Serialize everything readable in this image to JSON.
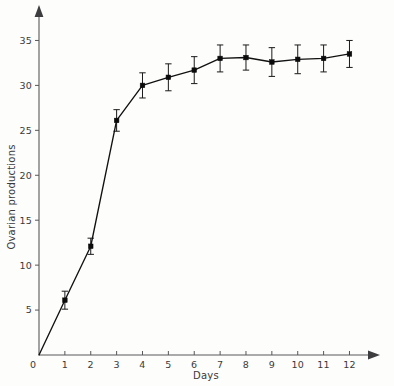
{
  "chart_data": {
    "type": "line",
    "title": "",
    "subtitle": "",
    "xlabel": "Days",
    "ylabel": "Ovarian productions",
    "xlim": [
      0,
      12.6
    ],
    "ylim": [
      0,
      37.5
    ],
    "grid": false,
    "legend": "none",
    "x_ticks": [
      "0",
      "1",
      "2",
      "3",
      "4",
      "5",
      "6",
      "7",
      "8",
      "9",
      "10",
      "11",
      "12"
    ],
    "x_tick_values": [
      0,
      1,
      2,
      3,
      4,
      5,
      6,
      7,
      8,
      9,
      10,
      11,
      12
    ],
    "y_ticks": [
      "5",
      "10",
      "15",
      "20",
      "25",
      "30",
      "35"
    ],
    "y_tick_values": [
      5,
      10,
      15,
      20,
      25,
      30,
      35
    ],
    "origin_label": "0",
    "x": [
      0,
      1,
      2,
      3,
      4,
      5,
      6,
      7,
      8,
      9,
      10,
      11,
      12
    ],
    "values": [
      0,
      6.1,
      12.1,
      26.1,
      30.0,
      30.9,
      31.7,
      33.0,
      33.1,
      32.6,
      32.9,
      33.0,
      33.5
    ],
    "error_lower": [
      0,
      1.0,
      0.9,
      1.2,
      1.4,
      1.5,
      1.5,
      1.5,
      1.4,
      1.6,
      1.6,
      1.5,
      1.5
    ],
    "error_upper": [
      0,
      1.0,
      0.9,
      1.2,
      1.4,
      1.5,
      1.5,
      1.5,
      1.4,
      1.6,
      1.6,
      1.5,
      1.5
    ],
    "series": [
      {
        "name": "Ovarian productions",
        "values": [
          0,
          6.1,
          12.1,
          26.1,
          30.0,
          30.9,
          31.7,
          33.0,
          33.1,
          32.6,
          32.9,
          33.0,
          33.5
        ]
      }
    ],
    "marker": "filled-square",
    "line_color": "#111111",
    "marker_color": "#0b0b0b",
    "axis_color": "#58585a",
    "background_color": "#fdfdfc"
  }
}
